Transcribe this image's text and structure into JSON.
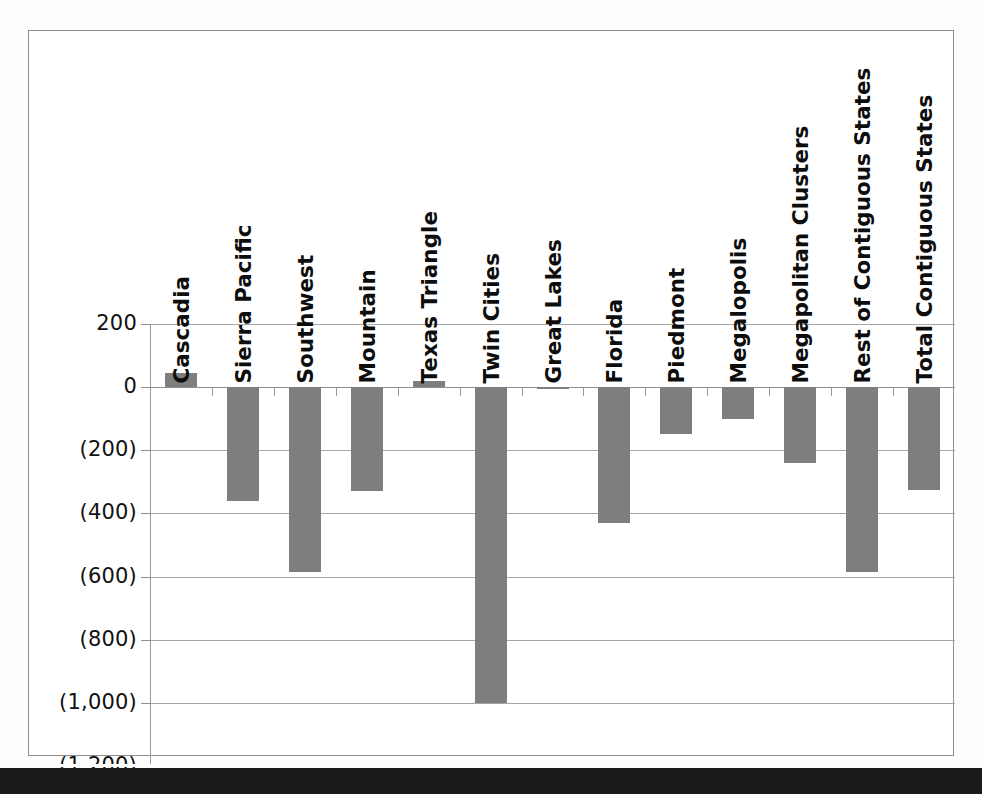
{
  "chart_data": {
    "type": "bar",
    "title": "",
    "xlabel": "",
    "ylabel": "",
    "ylim": [
      -1200,
      200
    ],
    "ytick_values": [
      200,
      0,
      -200,
      -400,
      -600,
      -800,
      -1000,
      -1200
    ],
    "ytick_labels": [
      "200",
      "0",
      "(200)",
      "(400)",
      "(600)",
      "(800)",
      "(1,000)",
      "(1,200)"
    ],
    "grid": true,
    "legend": "none",
    "bar_color": "#7e7e7e",
    "categories": [
      "Cascadia",
      "Sierra Pacific",
      "Southwest",
      "Mountain",
      "Texas Triangle",
      "Twin Cities",
      "Great Lakes",
      "Florida",
      "Piedmont",
      "Megalopolis",
      "Megapolitan Clusters",
      "Rest of Contiguous States",
      "Total Contiguous States"
    ],
    "values": [
      45,
      -360,
      -585,
      -330,
      20,
      -1000,
      -5,
      -430,
      -150,
      -100,
      -240,
      -585,
      -325
    ]
  },
  "axis": {
    "zero_label": "0"
  }
}
